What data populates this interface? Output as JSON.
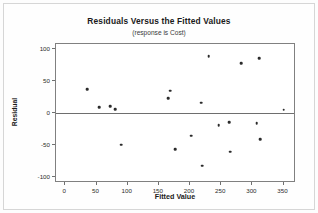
{
  "chart_data": {
    "type": "scatter",
    "title": "Residuals Versus the Fitted Values",
    "subtitle": "(response is Cost)",
    "xlabel": "Fitted Value",
    "ylabel": "Residual",
    "xlim": [
      -15,
      370
    ],
    "ylim": [
      -110,
      108
    ],
    "xticks": [
      0,
      50,
      100,
      150,
      200,
      250,
      300,
      350
    ],
    "yticks": [
      100,
      50,
      0,
      -50,
      -100
    ],
    "xtick_labels": [
      "0",
      "50",
      "100",
      "150",
      "200",
      "250",
      "300",
      "350"
    ],
    "ytick_labels": [
      "100",
      "50",
      "0",
      "-50",
      "-100"
    ],
    "grid": false,
    "legend": "none",
    "reference_line": {
      "axis": "y",
      "value": 0
    },
    "marker_color": "#2b2b2b",
    "points": [
      {
        "x": 35,
        "y": 37
      },
      {
        "x": 54,
        "y": 9
      },
      {
        "x": 72,
        "y": 10
      },
      {
        "x": 80,
        "y": 6
      },
      {
        "x": 90,
        "y": -50
      },
      {
        "x": 165,
        "y": 23
      },
      {
        "x": 168,
        "y": 35
      },
      {
        "x": 176,
        "y": -57
      },
      {
        "x": 202,
        "y": -36
      },
      {
        "x": 218,
        "y": 16
      },
      {
        "x": 220,
        "y": -83
      },
      {
        "x": 230,
        "y": 89
      },
      {
        "x": 246,
        "y": -19
      },
      {
        "x": 263,
        "y": -15
      },
      {
        "x": 264,
        "y": -61
      },
      {
        "x": 282,
        "y": 78
      },
      {
        "x": 307,
        "y": -16
      },
      {
        "x": 311,
        "y": 86
      },
      {
        "x": 313,
        "y": -41
      },
      {
        "x": 350,
        "y": 5
      }
    ]
  }
}
